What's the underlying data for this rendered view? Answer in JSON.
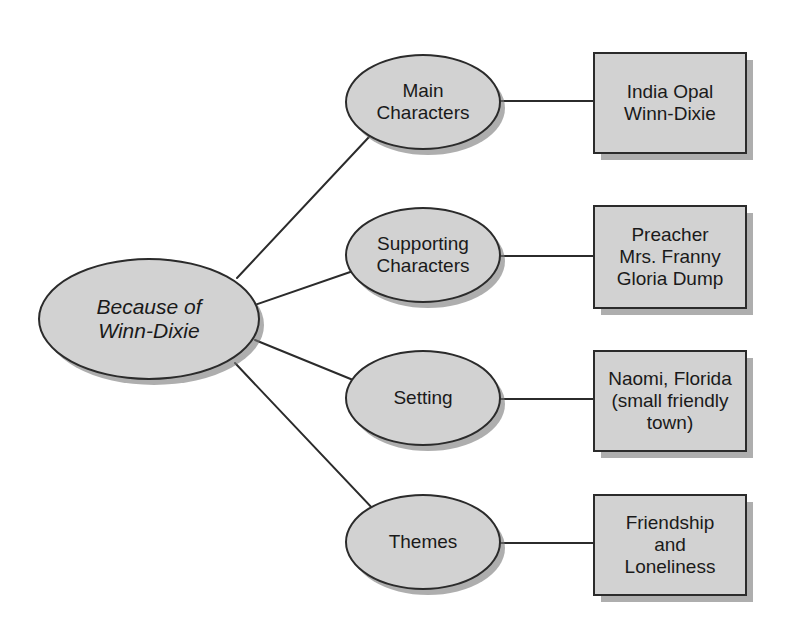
{
  "diagram": {
    "type": "concept-map",
    "title_node": {
      "id": "center",
      "shape": "ellipse",
      "label": "Because of\nWinn-Dixie",
      "italic": true
    },
    "branches": [
      {
        "id": "main-characters",
        "oval_label": "Main\nCharacters",
        "box_label": "India Opal\nWinn-Dixie"
      },
      {
        "id": "supporting-characters",
        "oval_label": "Supporting\nCharacters",
        "box_label": "Preacher\nMrs. Franny\nGloria Dump"
      },
      {
        "id": "setting",
        "oval_label": "Setting",
        "box_label": "Naomi, Florida\n(small friendly\ntown)"
      },
      {
        "id": "themes",
        "oval_label": "Themes",
        "box_label": "Friendship\nand\nLoneliness"
      }
    ],
    "colors": {
      "node_fill": "#d2d2d2",
      "node_border": "#2b2b2b",
      "shadow": "#7d7d7d",
      "text": "#1a1a1a",
      "background": "#ffffff",
      "edge": "#2b2b2b"
    }
  }
}
